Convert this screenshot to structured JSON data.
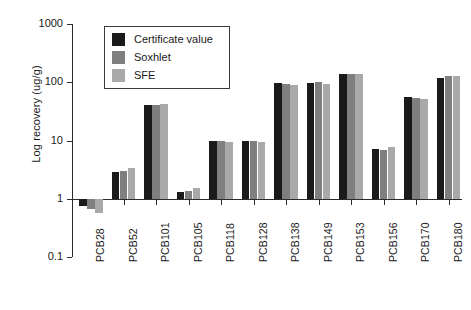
{
  "chart_data": {
    "type": "bar",
    "title": "",
    "subtitle": "",
    "xlabel": "",
    "ylabel": "Log recovery (ug/g)",
    "yscale": "log",
    "ylim": [
      0.1,
      1000
    ],
    "ytick_labels": [
      "1000",
      "100",
      "10",
      "1",
      "0.1"
    ],
    "ytick_values": [
      1000,
      100,
      10,
      1,
      0.1
    ],
    "grid": false,
    "legend_position": "upper-left-inside",
    "baseline": 1,
    "categories": [
      "PCB28",
      "PCB52",
      "PCB101",
      "PCB105",
      "PCB118",
      "PCB128",
      "PCB138",
      "PCB149",
      "PCB153",
      "PCB156",
      "PCB170",
      "PCB180"
    ],
    "series": [
      {
        "name": "Certificate value",
        "color": "#1a1a1a",
        "values": [
          0.75,
          2.9,
          40,
          1.3,
          10,
          9.8,
          96,
          98,
          140,
          7.2,
          55,
          118
        ]
      },
      {
        "name": "Soxhlet",
        "color": "#7f7f7f",
        "values": [
          0.68,
          3.0,
          40,
          1.35,
          10,
          10,
          93,
          100,
          140,
          7.0,
          53,
          130
        ]
      },
      {
        "name": "SFE",
        "color": "#a9a9a9",
        "values": [
          0.58,
          3.4,
          42,
          1.5,
          9.6,
          9.6,
          90,
          95,
          138,
          7.8,
          52,
          128
        ]
      }
    ]
  },
  "legend": {
    "entries": [
      {
        "label": "Certificate value",
        "color": "#1a1a1a"
      },
      {
        "label": "Soxhlet",
        "color": "#7f7f7f"
      },
      {
        "label": "SFE",
        "color": "#a9a9a9"
      }
    ]
  }
}
